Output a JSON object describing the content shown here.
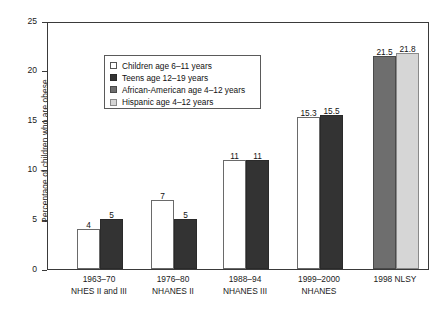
{
  "chart_data": {
    "type": "bar",
    "title": "",
    "subtitle": "",
    "xlabel": "",
    "ylabel": "Percentage of children who are obese",
    "ylim": [
      0,
      25
    ],
    "yticks": [
      0,
      5,
      10,
      15,
      20,
      25
    ],
    "ytick_labels": [
      "0",
      "5",
      "10",
      "15",
      "20",
      "25"
    ],
    "grid": false,
    "legend_position": "upper-left-inside",
    "categories": [
      "1963–70 NHES II and III",
      "1976–80 NHANES II",
      "1988–94 NHANES III",
      "1999–2000 NHANES",
      "1998 NLSY"
    ],
    "category_lines": [
      {
        "line1": "1963–70",
        "line2": "NHES II and III"
      },
      {
        "line1": "1976–80",
        "line2": "NHANES II"
      },
      {
        "line1": "1988–94",
        "line2": "NHANES III"
      },
      {
        "line1": "1999–2000",
        "line2": "NHANES"
      },
      {
        "line1": "1998 NLSY",
        "line2": ""
      }
    ],
    "series": [
      {
        "name": "Children age 6–11 years",
        "color": "#ffffff",
        "values": [
          4,
          7,
          11,
          15.3,
          null
        ]
      },
      {
        "name": "Teens age 12–19 years",
        "color": "#333333",
        "values": [
          5,
          5,
          11,
          15.5,
          null
        ]
      },
      {
        "name": "African-American age 4–12 years",
        "color": "#6e6e6e",
        "values": [
          null,
          null,
          null,
          null,
          21.5
        ]
      },
      {
        "name": "Hispanic age 4–12 years",
        "color": "#d6d6d6",
        "values": [
          null,
          null,
          null,
          null,
          21.8
        ]
      }
    ],
    "value_labels": [
      [
        "4",
        "5",
        "",
        ""
      ],
      [
        "7",
        "5",
        "",
        ""
      ],
      [
        "11",
        "11",
        "",
        ""
      ],
      [
        "15.3",
        "15.5",
        "",
        ""
      ],
      [
        "",
        "",
        "21.5",
        "21.8"
      ]
    ]
  },
  "legend": {
    "items": [
      {
        "label": "Children age 6–11 years",
        "swatch": "c0"
      },
      {
        "label": "Teens age 12–19 years",
        "swatch": "c1"
      },
      {
        "label": "African-American age 4–12 years",
        "swatch": "c2"
      },
      {
        "label": "Hispanic age 4–12 years",
        "swatch": "c3"
      }
    ]
  },
  "axes": {
    "y_title": "Percentage of children who are obese"
  }
}
